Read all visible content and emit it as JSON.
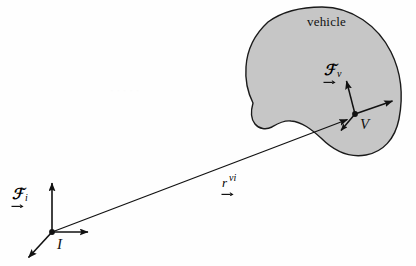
{
  "figure": {
    "type": "vector-diagram",
    "canvas": {
      "width": 416,
      "height": 266
    },
    "colors": {
      "background": "#fefefe",
      "blob_fill": "#c6c6c6",
      "blob_stroke": "#1a1a1a",
      "ink": "#111111"
    },
    "labels": {
      "vehicle_caption": "vehicle",
      "inertial_origin": "I",
      "vehicle_origin": "V",
      "frame_symbol": "ℱ",
      "inertial_frame_subscript": "i",
      "vehicle_frame_subscript": "v",
      "position_vector_glyph": "r",
      "position_vector_superscript": "vi"
    },
    "elements": {
      "vehicle_body": {
        "name": "vehicle-blob",
        "fill": "#c6c6c6",
        "stroke": "#1a1a1a"
      },
      "inertial_frame": {
        "origin": [
          52,
          232
        ],
        "axes": [
          {
            "name": "inertial-axis-up",
            "to": [
              52,
              182
            ]
          },
          {
            "name": "inertial-axis-right",
            "to": [
              89,
              232
            ]
          },
          {
            "name": "inertial-axis-down-left",
            "to": [
              27,
              259
            ]
          }
        ]
      },
      "vehicle_frame": {
        "origin": [
          355,
          114
        ],
        "axes": [
          {
            "name": "vehicle-axis-up-left",
            "to": [
              346,
              79
            ]
          },
          {
            "name": "vehicle-axis-up-right",
            "to": [
              394,
              100
            ]
          },
          {
            "name": "vehicle-axis-down-left",
            "to": [
              340,
              132
            ]
          }
        ]
      },
      "position_vector": {
        "name": "position-vector-r-vi",
        "from": [
          52,
          232
        ],
        "to": [
          348,
          119
        ]
      }
    }
  }
}
